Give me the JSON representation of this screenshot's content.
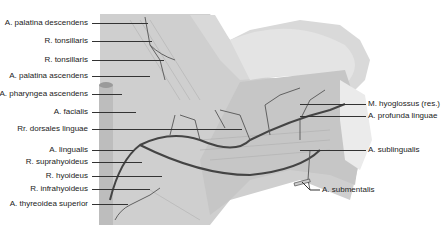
{
  "figure": {
    "left_labels": [
      {
        "text": "A. palatina descendens",
        "y": 23
      },
      {
        "text": "R. tonsillaris",
        "y": 41
      },
      {
        "text": "R. tonsillaris",
        "y": 60
      },
      {
        "text": "A. palatina ascendens",
        "y": 76
      },
      {
        "text": "A. pharyngea ascendens",
        "y": 94
      },
      {
        "text": "A. facialis",
        "y": 112
      },
      {
        "text": "Rr. dorsales linguae",
        "y": 129
      },
      {
        "text": "A. lingualis",
        "y": 150
      },
      {
        "text": "R. suprahyoideus",
        "y": 162
      },
      {
        "text": "R. hyoideus",
        "y": 176
      },
      {
        "text": "R. infrahyoideus",
        "y": 189
      },
      {
        "text": "A. thyreoidea superior",
        "y": 204
      }
    ],
    "right_labels": [
      {
        "text": "M. hyoglossus (res.)",
        "y": 104
      },
      {
        "text": "A. profunda linguae",
        "y": 116
      },
      {
        "text": "A. sublingualis",
        "y": 150
      },
      {
        "text": "A. submentalis",
        "y": 188
      }
    ]
  }
}
